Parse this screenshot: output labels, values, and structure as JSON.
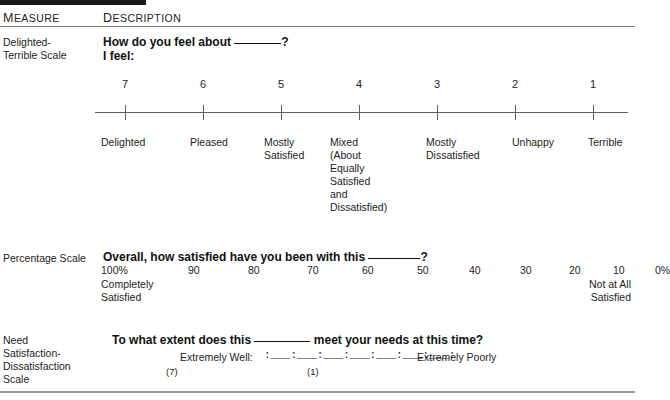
{
  "header": {
    "col_measure": "MEASURE",
    "col_description": "DESCRIPTION"
  },
  "rows": [
    {
      "measure_label": "Delighted-\nTerrible Scale",
      "question": "How do you feel about",
      "question_tail": "?",
      "subprompt": "I feel:",
      "scale": {
        "numbers": [
          "7",
          "6",
          "5",
          "4",
          "3",
          "2",
          "1"
        ],
        "words": [
          "Delighted",
          "Pleased",
          "Mostly\nSatisfied",
          "Mixed\n(About\nEqually\nSatisfied\nand\nDissatisfied)",
          "Mostly\nDissatisfied",
          "Unhappy",
          "Terrible"
        ]
      }
    },
    {
      "measure_label": "Percentage Scale",
      "question": "Overall, how satisfied have you been with this",
      "question_tail": "?",
      "scale": {
        "numbers": [
          "100%",
          "90",
          "80",
          "70",
          "60",
          "50",
          "40",
          "30",
          "20",
          "10",
          "0%"
        ],
        "left_anchor": "Completely\nSatisfied",
        "right_anchor": "Not at All\nSatisfied"
      }
    },
    {
      "measure_label": "Need\nSatisfaction-\nDissatisfaction\nScale",
      "question": "To what extent does this",
      "question_mid": "meet your needs at this time?",
      "scale": {
        "left_label": "Extremely Well:",
        "right_label": "Extremely Poorly",
        "track": ":___:___:___:___:___:___:___:",
        "paren_high": "(7)",
        "paren_low": "(1)"
      }
    }
  ],
  "colors": {
    "ink": "#1a1a1a",
    "rule": "#8c8c8c",
    "bar": "#1b1b1b",
    "page": "#ffffff"
  }
}
